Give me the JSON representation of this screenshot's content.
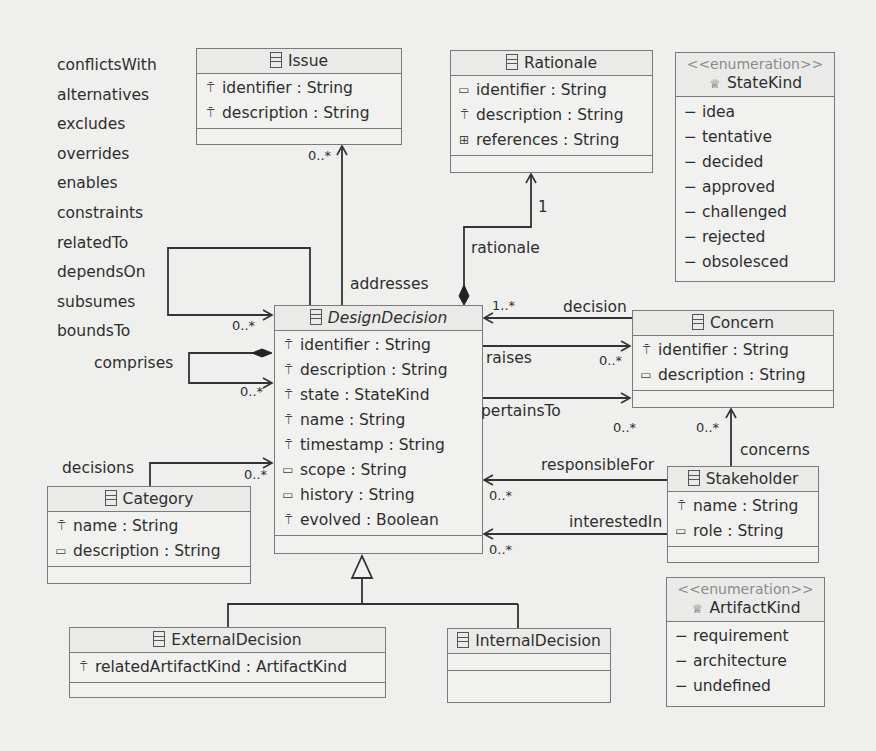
{
  "diagram": {
    "type": "UML class diagram",
    "relation_kinds": [
      "conflictsWith",
      "alternatives",
      "excludes",
      "overrides",
      "enables",
      "constraints",
      "relatedTo",
      "dependsOn",
      "subsumes",
      "boundsTo"
    ],
    "classes": {
      "issue": {
        "name": "Issue",
        "attributes": [
          {
            "icon": "key-attribute-icon",
            "text": "identifier : String"
          },
          {
            "icon": "key-attribute-icon",
            "text": "description : String"
          }
        ]
      },
      "rationale": {
        "name": "Rationale",
        "attributes": [
          {
            "icon": "attribute-icon",
            "text": "identifier : String"
          },
          {
            "icon": "key-attribute-icon",
            "text": "description : String"
          },
          {
            "icon": "multi-attribute-icon",
            "text": "references : String"
          }
        ]
      },
      "statekind": {
        "stereotype": "<<enumeration>>",
        "name": "StateKind",
        "literals": [
          "idea",
          "tentative",
          "decided",
          "approved",
          "challenged",
          "rejected",
          "obsolesced"
        ]
      },
      "designdecision": {
        "name": "DesignDecision",
        "attributes": [
          {
            "icon": "key-attribute-icon",
            "text": "identifier : String"
          },
          {
            "icon": "key-attribute-icon",
            "text": "description : String"
          },
          {
            "icon": "key-attribute-icon",
            "text": "state : StateKind"
          },
          {
            "icon": "key-attribute-icon",
            "text": "name : String"
          },
          {
            "icon": "key-attribute-icon",
            "text": "timestamp : String"
          },
          {
            "icon": "attribute-icon",
            "text": "scope : String"
          },
          {
            "icon": "attribute-icon",
            "text": "history : String"
          },
          {
            "icon": "key-attribute-icon",
            "text": "evolved : Boolean"
          }
        ]
      },
      "concern": {
        "name": "Concern",
        "attributes": [
          {
            "icon": "key-attribute-icon",
            "text": "identifier : String"
          },
          {
            "icon": "attribute-icon",
            "text": "description : String"
          }
        ]
      },
      "category": {
        "name": "Category",
        "attributes": [
          {
            "icon": "key-attribute-icon",
            "text": "name : String"
          },
          {
            "icon": "attribute-icon",
            "text": "description : String"
          }
        ]
      },
      "stakeholder": {
        "name": "Stakeholder",
        "attributes": [
          {
            "icon": "key-attribute-icon",
            "text": "name : String"
          },
          {
            "icon": "attribute-icon",
            "text": "role : String"
          }
        ]
      },
      "artifactkind": {
        "stereotype": "<<enumeration>>",
        "name": "ArtifactKind",
        "literals": [
          "requirement",
          "architecture",
          "undefined"
        ]
      },
      "externaldecision": {
        "name": "ExternalDecision",
        "attributes": [
          {
            "icon": "key-attribute-icon",
            "text": "relatedArtifactKind : ArtifactKind"
          }
        ]
      },
      "internaldecision": {
        "name": "InternalDecision",
        "attributes": []
      }
    },
    "associations": {
      "addresses": {
        "label": "addresses",
        "mult": "0..*"
      },
      "rationale": {
        "label": "rationale",
        "mult_target": "1",
        "mult_source": "1..*"
      },
      "decision": {
        "label": "decision"
      },
      "raises": {
        "label": "raises",
        "mult": "0..*"
      },
      "pertainsTo": {
        "label": "pertainsTo",
        "mult": "0..*"
      },
      "concerns": {
        "label": "concerns",
        "mult": "0..*"
      },
      "responsibleFor": {
        "label": "responsibleFor",
        "mult": "0..*"
      },
      "interestedIn": {
        "label": "interestedIn",
        "mult": "0..*"
      },
      "relation": {
        "mult": "0..*"
      },
      "comprises": {
        "label": "comprises",
        "mult": "0..*"
      },
      "decisions": {
        "label": "decisions",
        "mult": "0..*"
      }
    }
  }
}
